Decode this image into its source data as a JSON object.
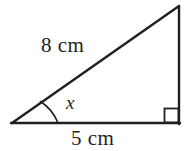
{
  "figure": {
    "type": "right-triangle-diagram",
    "stroke_color": "#231f20",
    "background_color": "#ffffff",
    "text_color": "#231f20",
    "labels": {
      "hypotenuse": "8 cm",
      "base": "5 cm",
      "angle": "x"
    },
    "geometry": {
      "vertex_left": [
        12,
        123
      ],
      "vertex_bottom_right": [
        179,
        123
      ],
      "vertex_top_right": [
        179,
        6
      ],
      "right_angle_marker": {
        "x": 164,
        "y": 108,
        "size": 14
      },
      "angle_arc": {
        "center": [
          12,
          123
        ],
        "radius": 46,
        "start": [
          40,
          101
        ],
        "end": [
          58,
          123
        ]
      }
    }
  }
}
